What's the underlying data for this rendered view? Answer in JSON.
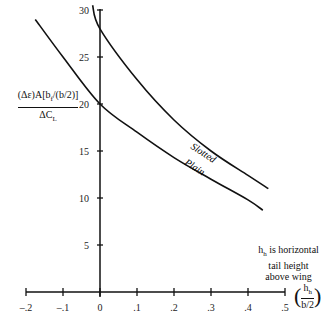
{
  "chart_data": {
    "type": "line",
    "title": "",
    "xlabel": "(h_h/(b/2))",
    "ylabel": "(Δε)A[b_f/(b/2)] / ΔC_L",
    "xlim": [
      -0.2,
      0.5
    ],
    "ylim": [
      0,
      30
    ],
    "grid": false,
    "x_ticks": [
      "-.2",
      "-.1",
      "0",
      ".1",
      ".2",
      ".3",
      ".4",
      ".5"
    ],
    "y_ticks": [
      "5",
      "10",
      "15",
      "20",
      "25",
      "30"
    ],
    "series": [
      {
        "name": "Slotted",
        "x": [
          -0.02,
          0,
          0.1,
          0.2,
          0.3,
          0.4,
          0.455
        ],
        "values": [
          30.5,
          28,
          22.6,
          18.3,
          15,
          12.4,
          11
        ]
      },
      {
        "name": "Plain",
        "x": [
          -0.175,
          -0.1,
          0,
          0.1,
          0.2,
          0.3,
          0.4,
          0.44
        ],
        "values": [
          29,
          25,
          20,
          17,
          14.3,
          12,
          9.8,
          8.7
        ]
      }
    ],
    "annotations": [
      "Slotted",
      "Plain",
      "h_h is horizontal tail height above wing"
    ]
  },
  "labels": {
    "y_num": "(Δε)A[b",
    "y_sub": "f",
    "y_num_tail": "/(b/2)]",
    "y_den": "ΔC",
    "y_den_sub": "L",
    "note_line1_pre": "h",
    "note_line1_sub": "h",
    "note_line1_post": " is horizontal",
    "note_line2": "tail height",
    "note_line3": "above wing",
    "x_unit_num": "h",
    "x_unit_num_sub": "h",
    "x_unit_den": "b/2",
    "slotted": "Slotted",
    "plain": "Plain"
  }
}
